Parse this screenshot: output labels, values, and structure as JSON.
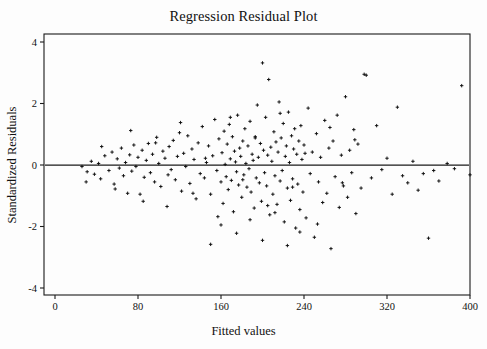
{
  "chart_data": {
    "type": "scatter",
    "title": "Regression Residual Plot",
    "xlabel": "Fitted values",
    "ylabel": "Standardized Residuals",
    "xlim": [
      0,
      400
    ],
    "ylim": [
      -4.6,
      4.6
    ],
    "xticks": [
      0,
      80,
      160,
      240,
      320,
      400
    ],
    "xtick_labels": [
      "0",
      "80",
      "160",
      "240",
      "320",
      "400"
    ],
    "yticks": [
      4,
      2,
      0,
      -2,
      -4
    ],
    "ytick_labels": [
      "4",
      "2",
      "0",
      "-2",
      "-4"
    ],
    "grid": false,
    "legend": null,
    "marker": "plus",
    "marker_color": "#0d0d0d",
    "reference_line": {
      "y": 0,
      "color": "#1a1a1a",
      "style": "solid"
    },
    "points": [
      [
        26,
        -0.05
      ],
      [
        31,
        -0.22
      ],
      [
        35,
        0.12
      ],
      [
        38,
        -0.3
      ],
      [
        42,
        0.05
      ],
      [
        44,
        -0.45
      ],
      [
        48,
        0.3
      ],
      [
        52,
        -0.18
      ],
      [
        55,
        0.42
      ],
      [
        57,
        -0.62
      ],
      [
        60,
        0.2
      ],
      [
        62,
        -0.1
      ],
      [
        64,
        0.55
      ],
      [
        66,
        -0.35
      ],
      [
        68,
        0.08
      ],
      [
        70,
        -0.92
      ],
      [
        72,
        0.33
      ],
      [
        74,
        -0.2
      ],
      [
        76,
        0.65
      ],
      [
        78,
        -0.05
      ],
      [
        80,
        0.25
      ],
      [
        82,
        -0.95
      ],
      [
        84,
        0.48
      ],
      [
        86,
        -0.4
      ],
      [
        88,
        0.15
      ],
      [
        90,
        0.7
      ],
      [
        92,
        -0.25
      ],
      [
        94,
        0.35
      ],
      [
        96,
        -0.55
      ],
      [
        98,
        0.9
      ],
      [
        100,
        0.05
      ],
      [
        102,
        -0.7
      ],
      [
        104,
        0.45
      ],
      [
        106,
        0.22
      ],
      [
        108,
        -1.35
      ],
      [
        110,
        0.6
      ],
      [
        112,
        -0.15
      ],
      [
        114,
        0.8
      ],
      [
        116,
        -0.48
      ],
      [
        118,
        0.28
      ],
      [
        120,
        1.05
      ],
      [
        122,
        -0.85
      ],
      [
        124,
        0.38
      ],
      [
        126,
        -0.05
      ],
      [
        128,
        0.95
      ],
      [
        130,
        -0.6
      ],
      [
        132,
        0.52
      ],
      [
        134,
        0.18
      ],
      [
        136,
        -1.1
      ],
      [
        138,
        0.72
      ],
      [
        140,
        -0.28
      ],
      [
        142,
        1.25
      ],
      [
        144,
        -0.42
      ],
      [
        146,
        0.08
      ],
      [
        148,
        0.62
      ],
      [
        150,
        -0.95
      ],
      [
        152,
        0.3
      ],
      [
        154,
        1.48
      ],
      [
        156,
        -0.18
      ],
      [
        158,
        0.85
      ],
      [
        160,
        -0.55
      ],
      [
        161,
        0.4
      ],
      [
        162,
        -1.25
      ],
      [
        163,
        1.1
      ],
      [
        164,
        0.02
      ],
      [
        165,
        -0.38
      ],
      [
        166,
        0.68
      ],
      [
        167,
        -0.8
      ],
      [
        168,
        1.32
      ],
      [
        169,
        0.2
      ],
      [
        170,
        -0.5
      ],
      [
        171,
        0.92
      ],
      [
        172,
        -1.52
      ],
      [
        173,
        0.45
      ],
      [
        174,
        0.1
      ],
      [
        175,
        -0.22
      ],
      [
        176,
        1.62
      ],
      [
        177,
        -0.65
      ],
      [
        178,
        0.55
      ],
      [
        179,
        0.28
      ],
      [
        180,
        -1.05
      ],
      [
        181,
        0.78
      ],
      [
        182,
        -0.32
      ],
      [
        183,
        1.18
      ],
      [
        184,
        0.05
      ],
      [
        185,
        -0.72
      ],
      [
        186,
        0.62
      ],
      [
        187,
        -0.12
      ],
      [
        188,
        1.42
      ],
      [
        189,
        -0.88
      ],
      [
        190,
        0.35
      ],
      [
        191,
        0.15
      ],
      [
        192,
        -1.4
      ],
      [
        193,
        0.88
      ],
      [
        194,
        -0.42
      ],
      [
        195,
        1.95
      ],
      [
        196,
        0.25
      ],
      [
        197,
        -0.58
      ],
      [
        198,
        0.7
      ],
      [
        199,
        -1.18
      ],
      [
        200,
        3.32
      ],
      [
        201,
        0.48
      ],
      [
        202,
        -0.25
      ],
      [
        203,
        1.55
      ],
      [
        204,
        -0.68
      ],
      [
        205,
        0.32
      ],
      [
        206,
        2.78
      ],
      [
        207,
        -1.62
      ],
      [
        208,
        0.58
      ],
      [
        209,
        0.12
      ],
      [
        210,
        -0.95
      ],
      [
        211,
        1.08
      ],
      [
        212,
        -0.35
      ],
      [
        213,
        0.75
      ],
      [
        214,
        -1.28
      ],
      [
        215,
        0.42
      ],
      [
        216,
        2.05
      ],
      [
        217,
        -0.52
      ],
      [
        218,
        0.88
      ],
      [
        219,
        -0.18
      ],
      [
        220,
        1.35
      ],
      [
        221,
        -1.85
      ],
      [
        222,
        0.28
      ],
      [
        223,
        0.62
      ],
      [
        224,
        -0.75
      ],
      [
        225,
        1.72
      ],
      [
        226,
        0.08
      ],
      [
        227,
        -1.15
      ],
      [
        228,
        0.95
      ],
      [
        229,
        -0.45
      ],
      [
        230,
        0.52
      ],
      [
        231,
        1.18
      ],
      [
        232,
        -2.05
      ],
      [
        233,
        0.35
      ],
      [
        234,
        -0.62
      ],
      [
        235,
        0.78
      ],
      [
        236,
        -1.45
      ],
      [
        237,
        1.28
      ],
      [
        238,
        0.18
      ],
      [
        239,
        -0.88
      ],
      [
        240,
        0.65
      ],
      [
        242,
        -1.72
      ],
      [
        244,
        1.85
      ],
      [
        246,
        -0.28
      ],
      [
        248,
        0.42
      ],
      [
        250,
        -2.35
      ],
      [
        252,
        1.02
      ],
      [
        254,
        -0.55
      ],
      [
        256,
        0.25
      ],
      [
        258,
        -1.22
      ],
      [
        260,
        1.45
      ],
      [
        262,
        -0.92
      ],
      [
        264,
        0.55
      ],
      [
        266,
        -2.72
      ],
      [
        268,
        0.78
      ],
      [
        270,
        -0.38
      ],
      [
        272,
        1.62
      ],
      [
        274,
        -1.38
      ],
      [
        276,
        0.32
      ],
      [
        278,
        -0.68
      ],
      [
        280,
        2.22
      ],
      [
        282,
        -1.05
      ],
      [
        284,
        0.48
      ],
      [
        286,
        -0.25
      ],
      [
        288,
        1.15
      ],
      [
        290,
        -1.58
      ],
      [
        292,
        0.68
      ],
      [
        295,
        -0.75
      ],
      [
        298,
        2.95
      ],
      [
        300,
        2.92
      ],
      [
        305,
        -0.42
      ],
      [
        310,
        1.28
      ],
      [
        315,
        -0.15
      ],
      [
        320,
        0.22
      ],
      [
        325,
        -0.95
      ],
      [
        330,
        1.88
      ],
      [
        335,
        -0.35
      ],
      [
        340,
        -0.58
      ],
      [
        345,
        0.12
      ],
      [
        350,
        -0.82
      ],
      [
        355,
        -0.28
      ],
      [
        360,
        -2.38
      ],
      [
        365,
        -0.18
      ],
      [
        370,
        -0.52
      ],
      [
        378,
        0.05
      ],
      [
        385,
        -0.12
      ],
      [
        392,
        2.58
      ],
      [
        400,
        -0.32
      ],
      [
        412,
        2.58
      ],
      [
        450,
        2.18
      ],
      [
        30,
        -0.55
      ],
      [
        45,
        0.6
      ],
      [
        58,
        -0.78
      ],
      [
        73,
        1.12
      ],
      [
        85,
        -1.18
      ],
      [
        97,
        0.72
      ],
      [
        109,
        -0.32
      ],
      [
        121,
        1.38
      ],
      [
        133,
        -0.92
      ],
      [
        145,
        0.22
      ],
      [
        157,
        -1.68
      ],
      [
        169,
        1.55
      ],
      [
        181,
        -0.48
      ],
      [
        193,
        0.92
      ],
      [
        205,
        -1.32
      ],
      [
        217,
        1.68
      ],
      [
        229,
        -0.72
      ],
      [
        241,
        0.38
      ],
      [
        253,
        -1.92
      ],
      [
        265,
        1.22
      ],
      [
        277,
        -0.58
      ],
      [
        289,
        0.82
      ],
      [
        150,
        -2.58
      ],
      [
        160,
        -1.95
      ],
      [
        175,
        -2.22
      ],
      [
        188,
        -1.78
      ],
      [
        200,
        -2.45
      ],
      [
        212,
        -1.55
      ],
      [
        224,
        -2.62
      ],
      [
        236,
        -2.18
      ]
    ]
  }
}
